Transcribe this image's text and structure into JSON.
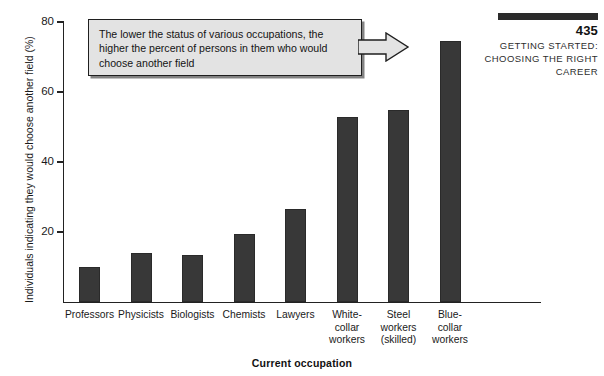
{
  "page_header": {
    "page_number": "435",
    "subtitle_line_1": "GETTING STARTED:",
    "subtitle_line_2": "CHOOSING THE RIGHT",
    "subtitle_line_3": "CAREER",
    "rule_color": "#2b2b2b"
  },
  "callout": {
    "text": "The lower the status of various occupations, the higher the percent of persons in them who would choose another field",
    "arrow_icon": "arrow-right-icon",
    "fill_color": "#e3e3e3",
    "border_color": "#1f1f1f"
  },
  "chart_data": {
    "type": "bar",
    "title": "",
    "xlabel": "Current occupation",
    "ylabel": "Individuals indicating they would choose another field (%)",
    "categories": [
      "Professors",
      "Physicists",
      "Biologists",
      "Chemists",
      "Lawyers",
      "White-collar workers",
      "Steel workers (skilled)",
      "Blue-collar workers"
    ],
    "category_label_lines": [
      [
        "Professors"
      ],
      [
        "Physicists"
      ],
      [
        "Biologists"
      ],
      [
        "Chemists"
      ],
      [
        "Lawyers"
      ],
      [
        "White-",
        "collar",
        "workers"
      ],
      [
        "Steel",
        "workers",
        "(skilled)"
      ],
      [
        "Blue-",
        "collar",
        "workers"
      ]
    ],
    "values": [
      10,
      14,
      13.5,
      19.5,
      26.5,
      53,
      55,
      74.5
    ],
    "ylim": [
      0,
      80
    ],
    "yticks": [
      20,
      40,
      60,
      80
    ],
    "ytick_labels": [
      "20",
      "40",
      "60",
      "80"
    ],
    "grid": false,
    "legend": false,
    "bar_color": "#383838"
  }
}
